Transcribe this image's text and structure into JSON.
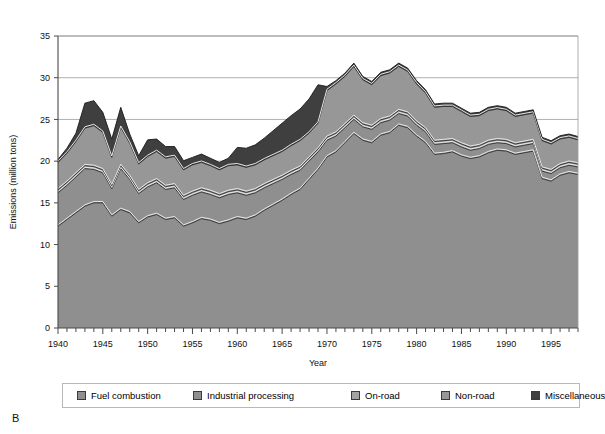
{
  "panel": {
    "letter": "B"
  },
  "chart_data": {
    "type": "area",
    "stacked": true,
    "title": "",
    "xlabel": "Year",
    "ylabel": "Emissions (million tons)",
    "xlim": [
      1940,
      1998
    ],
    "ylim": [
      0,
      35
    ],
    "yticks": [
      0,
      5,
      10,
      15,
      20,
      25,
      30,
      35
    ],
    "xticks": [
      1940,
      1945,
      1950,
      1955,
      1960,
      1965,
      1970,
      1975,
      1980,
      1985,
      1990,
      1995
    ],
    "xtick_minor_step": 1,
    "grid": "horizontal",
    "legend_position": "bottom",
    "units": "million tons",
    "x": [
      1940,
      1941,
      1942,
      1943,
      1944,
      1945,
      1946,
      1947,
      1948,
      1949,
      1950,
      1951,
      1952,
      1953,
      1954,
      1955,
      1956,
      1957,
      1958,
      1959,
      1960,
      1961,
      1962,
      1963,
      1964,
      1965,
      1966,
      1967,
      1968,
      1969,
      1970,
      1971,
      1972,
      1973,
      1974,
      1975,
      1976,
      1977,
      1978,
      1979,
      1980,
      1981,
      1982,
      1983,
      1984,
      1985,
      1986,
      1987,
      1988,
      1989,
      1990,
      1991,
      1992,
      1993,
      1994,
      1995,
      1996,
      1997,
      1998
    ],
    "series": [
      {
        "name": "Fuel combustion",
        "color": "#8f8f8f",
        "values": [
          12.2,
          13.0,
          13.8,
          14.6,
          15.0,
          15.0,
          13.4,
          14.2,
          13.8,
          12.6,
          13.3,
          13.6,
          13.0,
          13.2,
          12.2,
          12.6,
          13.1,
          12.9,
          12.5,
          12.8,
          13.2,
          13.0,
          13.4,
          14.1,
          14.7,
          15.3,
          16.0,
          16.6,
          17.8,
          19.0,
          20.5,
          21.1,
          22.2,
          23.3,
          22.5,
          22.2,
          23.1,
          23.4,
          24.3,
          24.0,
          23.0,
          22.2,
          20.8,
          20.9,
          21.1,
          20.6,
          20.3,
          20.5,
          21.0,
          21.3,
          21.2,
          20.8,
          21.0,
          21.2,
          17.9,
          17.6,
          18.3,
          18.6,
          18.4
        ]
      },
      {
        "name": "Industrial processing",
        "color": "#8f8f8f",
        "values": [
          4.0,
          4.1,
          4.3,
          4.5,
          4.0,
          3.6,
          3.3,
          4.9,
          4.0,
          3.5,
          3.6,
          3.8,
          3.6,
          3.6,
          3.2,
          3.3,
          3.2,
          3.1,
          3.1,
          3.2,
          3.0,
          2.9,
          2.8,
          2.7,
          2.6,
          2.5,
          2.4,
          2.3,
          2.2,
          2.1,
          2.0,
          1.9,
          1.8,
          1.7,
          1.6,
          1.6,
          1.5,
          1.5,
          1.4,
          1.4,
          1.3,
          1.3,
          1.2,
          1.2,
          1.1,
          1.1,
          1.0,
          1.0,
          1.0,
          0.9,
          0.9,
          0.9,
          0.9,
          0.9,
          0.9,
          0.9,
          0.9,
          0.9,
          0.9
        ]
      },
      {
        "name": "On-road",
        "color": "#a3a3a3",
        "values": [
          0.35,
          0.35,
          0.35,
          0.35,
          0.35,
          0.35,
          0.35,
          0.35,
          0.35,
          0.35,
          0.35,
          0.35,
          0.35,
          0.35,
          0.35,
          0.35,
          0.35,
          0.35,
          0.35,
          0.35,
          0.35,
          0.35,
          0.35,
          0.35,
          0.35,
          0.35,
          0.35,
          0.35,
          0.35,
          0.35,
          0.35,
          0.35,
          0.35,
          0.35,
          0.35,
          0.35,
          0.35,
          0.35,
          0.35,
          0.35,
          0.35,
          0.35,
          0.35,
          0.35,
          0.35,
          0.35,
          0.35,
          0.35,
          0.35,
          0.35,
          0.35,
          0.35,
          0.35,
          0.35,
          0.35,
          0.35,
          0.35,
          0.35,
          0.35
        ]
      },
      {
        "name": "Non-road",
        "color": "#979797",
        "values": [
          3.3,
          3.5,
          3.9,
          4.5,
          4.9,
          4.5,
          3.4,
          4.6,
          4.0,
          3.2,
          3.3,
          3.4,
          3.4,
          3.4,
          3.2,
          3.3,
          3.2,
          3.1,
          3.0,
          3.1,
          3.0,
          3.0,
          3.0,
          3.0,
          3.0,
          3.0,
          3.1,
          3.2,
          3.0,
          3.1,
          5.6,
          5.9,
          5.8,
          6.0,
          5.3,
          5.0,
          5.3,
          5.3,
          5.3,
          5.0,
          4.6,
          4.3,
          4.1,
          4.1,
          4.0,
          3.9,
          3.7,
          3.6,
          3.7,
          3.7,
          3.6,
          3.3,
          3.3,
          3.3,
          3.3,
          3.2,
          3.1,
          3.0,
          2.9
        ]
      },
      {
        "name": "Miscellaneous",
        "color": "#3f3f3f",
        "values": [
          0.35,
          0.6,
          1.0,
          3.0,
          3.0,
          2.4,
          2.2,
          2.4,
          1.1,
          1.0,
          2.0,
          1.5,
          1.4,
          1.2,
          1.1,
          0.9,
          1.0,
          0.9,
          0.9,
          0.9,
          2.1,
          2.3,
          2.4,
          2.6,
          3.0,
          3.4,
          3.6,
          3.8,
          4.1,
          4.6,
          0.5,
          0.4,
          0.4,
          0.4,
          0.4,
          0.4,
          0.4,
          0.4,
          0.4,
          0.4,
          0.4,
          0.4,
          0.4,
          0.4,
          0.4,
          0.4,
          0.4,
          0.4,
          0.4,
          0.4,
          0.4,
          0.4,
          0.4,
          0.4,
          0.4,
          0.4,
          0.4,
          0.4,
          0.4
        ]
      }
    ]
  },
  "legend": {
    "items": [
      {
        "label": "Fuel combustion",
        "color": "#8f8f8f"
      },
      {
        "label": "Industrial processing",
        "color": "#8f8f8f"
      },
      {
        "label": "On-road",
        "color": "#a3a3a3"
      },
      {
        "label": "Non-road",
        "color": "#979797"
      },
      {
        "label": "Miscellaneous",
        "color": "#3f3f3f"
      }
    ]
  }
}
